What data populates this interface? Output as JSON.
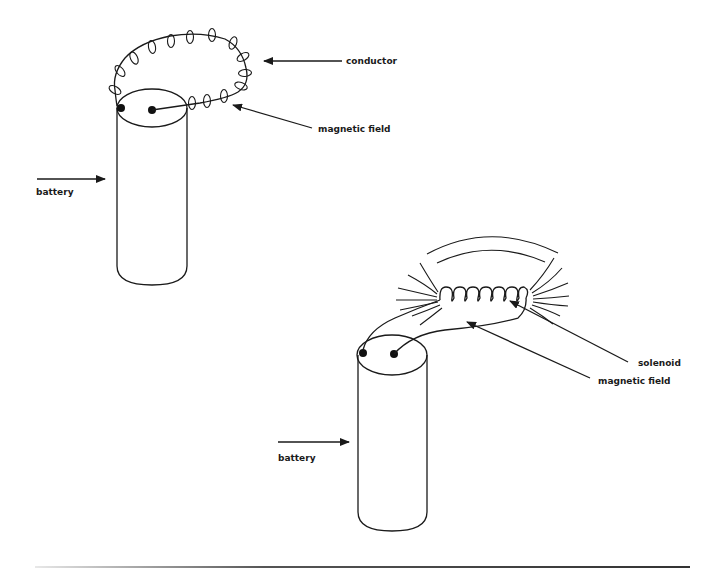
{
  "diagram": {
    "title": "",
    "figure_top": {
      "name": "current loop with magnetic field",
      "labels": {
        "conductor": "conductor",
        "magnetic_field": "magnetic field",
        "battery": "battery"
      }
    },
    "figure_bottom": {
      "name": "solenoid with magnetic field",
      "labels": {
        "solenoid": "solenoid",
        "magnetic_field": "magnetic field",
        "battery": "battery"
      }
    },
    "colors": {
      "ink": "#1a1a1a",
      "background": "#ffffff"
    }
  }
}
